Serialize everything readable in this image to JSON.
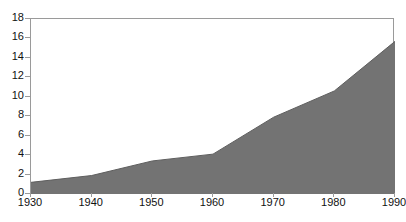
{
  "chart_data": {
    "type": "area",
    "title": "",
    "caption": "Millions of tons",
    "xlabel": "",
    "ylabel": "Millions of tons",
    "grid": false,
    "legend": "none",
    "fill_color": "#737373",
    "line_color": "#5e5e5e",
    "frame_color": "#9a9a9a",
    "x": [
      1930,
      1940,
      1950,
      1960,
      1970,
      1980,
      1990
    ],
    "categories": [
      "1930",
      "1940",
      "1950",
      "1960",
      "1970",
      "1980",
      "1990"
    ],
    "values": [
      1.2,
      1.9,
      3.4,
      4.1,
      7.9,
      10.6,
      15.7
    ],
    "series": [
      {
        "name": "Volume",
        "values": [
          1.2,
          1.9,
          3.4,
          4.1,
          7.9,
          10.6,
          15.7
        ]
      }
    ],
    "xlim": [
      1930,
      1990
    ],
    "ylim": [
      0,
      18
    ],
    "ytick_values": [
      0,
      2,
      4,
      6,
      8,
      10,
      12,
      14,
      16,
      18
    ],
    "ytick_labels": [
      "0",
      "2",
      "4",
      "6",
      "8",
      "10",
      "12",
      "14",
      "16",
      "18"
    ],
    "xtick_labels": [
      "1930",
      "1940",
      "1950",
      "1960",
      "1970",
      "1980",
      "1990"
    ]
  }
}
